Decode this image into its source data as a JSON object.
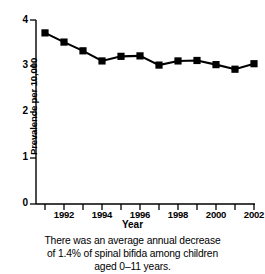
{
  "chart_data": {
    "type": "line",
    "title": "",
    "xlabel": "Year",
    "ylabel": "Prevalence per 10,000",
    "x": [
      1991,
      1992,
      1993,
      1994,
      1995,
      1996,
      1997,
      1998,
      1999,
      2000,
      2001,
      2002
    ],
    "values": [
      3.72,
      3.52,
      3.33,
      3.11,
      3.21,
      3.22,
      3.02,
      3.11,
      3.12,
      3.03,
      2.93,
      3.05
    ],
    "series": [
      {
        "name": "Prevalence of spina bifida per 10,000",
        "values": [
          3.72,
          3.52,
          3.33,
          3.11,
          3.21,
          3.22,
          3.02,
          3.11,
          3.12,
          3.03,
          2.93,
          3.05
        ]
      }
    ],
    "xlim": [
      1990.5,
      2002.5
    ],
    "ylim": [
      0,
      4
    ],
    "xticks": [
      1991,
      1992,
      1993,
      1994,
      1995,
      1996,
      1997,
      1998,
      1999,
      2000,
      2001,
      2002
    ],
    "xtick_labels": [
      "",
      "1992",
      "",
      "1994",
      "",
      "1996",
      "",
      "1998",
      "",
      "2000",
      "",
      "2002"
    ],
    "yticks": [
      0,
      1,
      2,
      3,
      4
    ],
    "ytick_labels": [
      "0",
      "1",
      "2",
      "3",
      "4"
    ],
    "grid": false,
    "legend": "none",
    "marker": "square",
    "line_color": "#000000",
    "marker_color": "#000000"
  },
  "axis": {
    "y_title": "Prevalence per 10,000",
    "x_title": "Year",
    "y_ticks": [
      {
        "label": "4",
        "value": 4
      },
      {
        "label": "3",
        "value": 3
      },
      {
        "label": "2",
        "value": 2
      },
      {
        "label": "1",
        "value": 1
      },
      {
        "label": "0",
        "value": 0
      }
    ],
    "x_ticks": [
      {
        "label": "1992",
        "value": 1992
      },
      {
        "label": "1994",
        "value": 1994
      },
      {
        "label": "1996",
        "value": 1996
      },
      {
        "label": "1998",
        "value": 1998
      },
      {
        "label": "2000",
        "value": 2000
      },
      {
        "label": "2002",
        "value": 2002
      }
    ]
  },
  "caption": {
    "line1": "There was an average annual decrease",
    "line2": "of 1.4% of spinal bifida among children",
    "line3": "aged 0–11 years."
  },
  "colors": {
    "background": "#ffffff",
    "foreground": "#000000"
  }
}
